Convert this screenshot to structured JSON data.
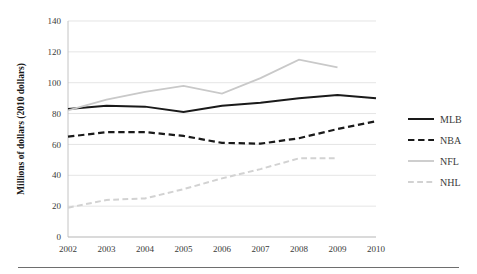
{
  "chart_data": {
    "type": "line",
    "title": "",
    "xlabel": "",
    "ylabel": "Millions of dollars (2010 dollars)",
    "categories": [
      2002,
      2003,
      2004,
      2005,
      2006,
      2007,
      2008,
      2009,
      2010
    ],
    "xticklabels": [
      "2002",
      "2003",
      "2004",
      "2005",
      "2006",
      "2007",
      "2008",
      "2009",
      "2010"
    ],
    "yticks": [
      0,
      20,
      40,
      60,
      80,
      100,
      120,
      140
    ],
    "yticklabels": [
      "0",
      "20",
      "40",
      "60",
      "80",
      "100",
      "120",
      "140"
    ],
    "ylim": [
      0,
      140
    ],
    "grid": "horizontal",
    "legend_position": "right",
    "series": [
      {
        "name": "MLB",
        "color": "#1a1a1a",
        "style": "solid",
        "width": 2.0,
        "values": [
          83,
          85,
          84.5,
          81,
          85,
          87,
          90,
          92,
          90
        ]
      },
      {
        "name": "NBA",
        "color": "#1a1a1a",
        "style": "dashed",
        "width": 2.2,
        "values": [
          65,
          68,
          68,
          65.5,
          61,
          60.5,
          64,
          70,
          75
        ]
      },
      {
        "name": "NFL",
        "color": "#c9c9c9",
        "style": "solid",
        "width": 1.8,
        "values": [
          82,
          89,
          94,
          98,
          93,
          103,
          115,
          110,
          null
        ]
      },
      {
        "name": "NHL",
        "color": "#d2d2d2",
        "style": "dashed",
        "width": 2.0,
        "values": [
          19,
          24,
          25,
          31,
          38,
          44,
          51,
          51,
          null
        ]
      }
    ]
  },
  "legend": {
    "items": [
      {
        "label": "MLB"
      },
      {
        "label": "NBA"
      },
      {
        "label": "NFL"
      },
      {
        "label": "NHL"
      }
    ]
  }
}
